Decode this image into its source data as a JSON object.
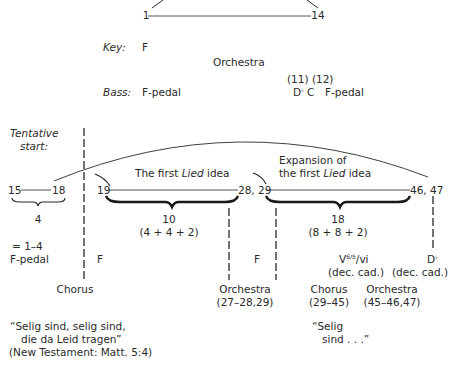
{
  "top": {
    "start_measure": "1",
    "end_measure": "14",
    "key_label": "Key:",
    "key_value": "F",
    "section_label": "Orchestra",
    "bass_label": "Bass:",
    "bass_start": "F-pedal",
    "bass_numbers": "(11) (12)",
    "bass_d": "D",
    "bass_d_accidental": "♭",
    "bass_c": "C",
    "bass_end": "F-pedal"
  },
  "tentative": {
    "label_line1": "Tentative",
    "label_line2": "start:",
    "m_start": "15",
    "m_end": "18",
    "length": "4",
    "equals": "= 1–4",
    "bass": "F-pedal"
  },
  "first_lied": {
    "title_pre": "The first ",
    "title_italic": "Lied",
    "title_post": " idea",
    "m_start": "19",
    "m_end": "28, 29",
    "length": "10",
    "grouping": "(4 + 4 + 2)",
    "key": "F"
  },
  "expansion": {
    "title_line1": "Expansion of",
    "title_pre": "the first ",
    "title_italic": "Lied",
    "title_post": " idea",
    "m_end": "46, 47",
    "length": "18",
    "grouping": "(8 + 8 + 2)",
    "key": "F",
    "harmony": "V",
    "harmony_sup": "6/5",
    "harmony_post": "/vi",
    "harmony_note": "(dec. cad.)",
    "end_chord": "D",
    "end_chord_accidental": "♭",
    "end_note": "(dec. cad.)"
  },
  "forces": {
    "chorus1": "Chorus",
    "orchestra1": "Orchestra",
    "orchestra1_range": "(27–28,29)",
    "chorus2": "Chorus",
    "chorus2_range": "(29–45)",
    "orchestra2": "Orchestra",
    "orchestra2_range": "(45–46,47)"
  },
  "text": {
    "quote1_line1": "“Selig sind, selig sind,",
    "quote1_line2": "die da Leid tragen”",
    "quote1_source": "(New Testament: Matt. 5:4)",
    "quote2_line1": "“Selig",
    "quote2_line2": "sind . . .”"
  }
}
